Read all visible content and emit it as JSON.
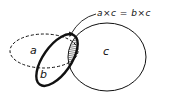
{
  "diagram": {
    "type": "venn",
    "sets": [
      {
        "id": "a",
        "label": "a",
        "line_style": "dashed"
      },
      {
        "id": "b",
        "label": "b",
        "line_style": "thick-solid"
      },
      {
        "id": "c",
        "label": "c",
        "line_style": "thin-solid"
      }
    ],
    "shaded_region": "intersection of b and c (and a)",
    "annotation": "a×c = b×c",
    "colors": {
      "stroke": "#111111",
      "background": "#ffffff",
      "hatch": "#333333"
    }
  }
}
